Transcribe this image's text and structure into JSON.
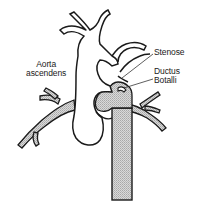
{
  "diagram": {
    "type": "anatomical-illustration",
    "colors": {
      "outline": "#1a1a1a",
      "vessel_fill": "#ffffff",
      "shaded_fill": "#c8c8c8",
      "background": "#ffffff"
    },
    "labels": {
      "aorta_ascendens": {
        "line1": "Aorta",
        "line2": "ascendens"
      },
      "stenose": "Stenose",
      "ductus_botalli": {
        "line1": "Ductus",
        "line2": "Botalli"
      }
    }
  }
}
